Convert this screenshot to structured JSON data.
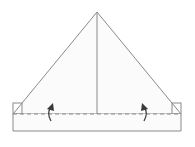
{
  "diagram": {
    "type": "origami-fold-step",
    "colors": {
      "background": "#ffffff",
      "paper_fill": "#fbfbfb",
      "line": "#8a8a8a",
      "dash": "#8a8a8a",
      "arrow": "#3a3a3a"
    },
    "shapes": {
      "triangle": {
        "apex": [
          97,
          12
        ],
        "left": [
          13,
          114
        ],
        "right": [
          181,
          114
        ]
      },
      "center_line": {
        "from": [
          97,
          12
        ],
        "to": [
          97,
          114
        ]
      },
      "band": {
        "x": 13,
        "y": 114,
        "width": 168,
        "height": 17
      },
      "left_flap": {
        "x": 13,
        "y": 103,
        "width": 9,
        "height": 11
      },
      "right_flap": {
        "x": 172,
        "y": 103,
        "width": 9,
        "height": 11
      },
      "fold_line": {
        "y": 114,
        "style": "dashed"
      }
    },
    "arrows": [
      {
        "name": "left-fold-up-arrow",
        "x": 50,
        "direction": "up"
      },
      {
        "name": "right-fold-up-arrow",
        "x": 145,
        "direction": "up"
      }
    ]
  }
}
